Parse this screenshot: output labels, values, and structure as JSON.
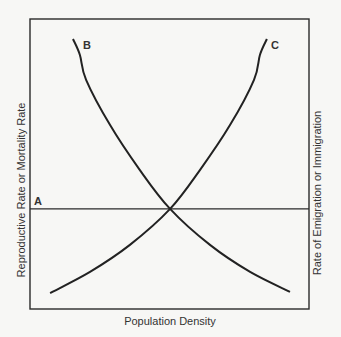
{
  "chart_data": {
    "type": "line",
    "title": "",
    "xlabel": "Population Density",
    "ylabel_left": "Reproductive Rate or Mortality Rate",
    "ylabel_right": "Rate of Emigration or Immigration",
    "xlim": [
      0,
      100
    ],
    "ylim": [
      0,
      100
    ],
    "grid": false,
    "ticks": false,
    "legend": "none (curves labeled inline)",
    "series": [
      {
        "name": "A",
        "label_position": "left",
        "x": [
          0,
          100
        ],
        "y": [
          34.5,
          34.5
        ]
      },
      {
        "name": "B",
        "label_position": "top",
        "x": [
          15.4,
          17.9,
          20.1,
          28.7,
          39.4,
          50.2,
          64.5,
          78.9,
          93.2
        ],
        "y": [
          93.1,
          87.6,
          79.0,
          63.4,
          47.9,
          34.5,
          22.1,
          12.8,
          5.9
        ]
      },
      {
        "name": "C",
        "label_position": "top",
        "x": [
          7.2,
          21.5,
          35.8,
          50.2,
          60.9,
          71.7,
          80.3,
          82.4,
          84.9
        ],
        "y": [
          5.5,
          12.8,
          22.1,
          34.5,
          47.9,
          63.4,
          79.0,
          87.6,
          93.1
        ]
      }
    ],
    "annotations": [
      {
        "text": "A",
        "near": "left end of horizontal line"
      },
      {
        "text": "B",
        "near": "top of descending curve"
      },
      {
        "text": "C",
        "near": "top of ascending curve"
      }
    ]
  },
  "labels": {
    "x_axis": "Population Density",
    "y_axis_left": "Reproductive Rate or Mortality Rate",
    "y_axis_right": "Rate of Emigration or Immigration",
    "curve_a": "A",
    "curve_b": "B",
    "curve_c": "C"
  },
  "colors": {
    "background": "#f7f7f5",
    "ink": "#2a2a2a"
  }
}
